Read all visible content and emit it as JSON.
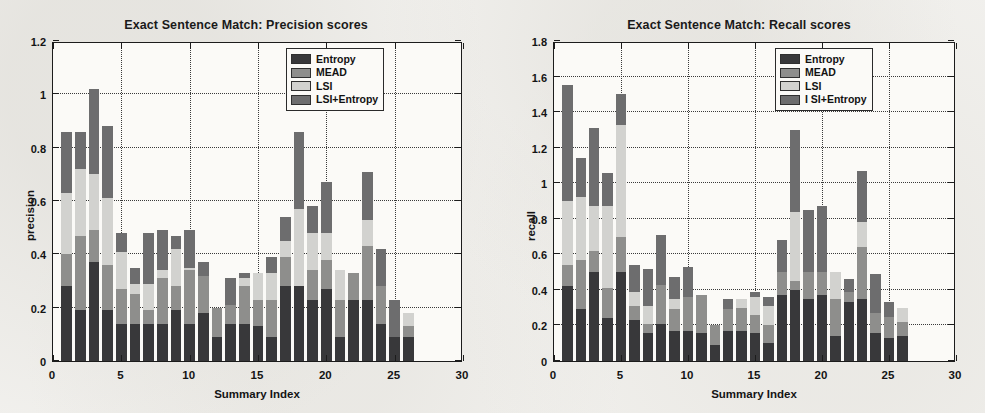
{
  "figure": {
    "panels": [
      "precision",
      "recall"
    ]
  },
  "chart_data": [
    {
      "type": "bar",
      "barmode": "stacked",
      "title": "Exact Sentence Match: Precision scores",
      "xlabel": "Summary Index",
      "ylabel": "precision",
      "xlim": [
        0,
        30
      ],
      "ylim": [
        0,
        1.2
      ],
      "xticks": [
        0,
        5,
        10,
        15,
        20,
        25,
        30
      ],
      "xticklabels": [
        "0",
        "5",
        "10",
        "15",
        "20",
        "25",
        "30"
      ],
      "yticks": [
        0,
        0.2,
        0.4,
        0.6,
        0.8,
        1,
        1.2
      ],
      "yticklabels": [
        "0",
        "0.2",
        "0.4",
        "0.6",
        "0.8",
        "1",
        "1.2"
      ],
      "grid": true,
      "grid_style": "dotted",
      "legend_position": "top-right",
      "legend": [
        "Entropy",
        "MEAD",
        "LSI",
        "LSI+Entropy"
      ],
      "colors": [
        "#38383a",
        "#8e8e8c",
        "#d2d2cf",
        "#6d6d6e"
      ],
      "categories": [
        1,
        2,
        3,
        4,
        5,
        6,
        7,
        8,
        9,
        10,
        11,
        12,
        13,
        14,
        15,
        16,
        17,
        18,
        19,
        20,
        21,
        22,
        23,
        24,
        25,
        26
      ],
      "series": [
        {
          "name": "Entropy",
          "values": [
            0.28,
            0.19,
            0.37,
            0.19,
            0.14,
            0.14,
            0.14,
            0.14,
            0.19,
            0.14,
            0.18,
            0.09,
            0.14,
            0.14,
            0.13,
            0.09,
            0.28,
            0.28,
            0.23,
            0.27,
            0.09,
            0.23,
            0.23,
            0.14,
            0.09,
            0.09
          ]
        },
        {
          "name": "MEAD",
          "values": [
            0.12,
            0.28,
            0.12,
            0.17,
            0.13,
            0.11,
            0.05,
            0.17,
            0.09,
            0.2,
            0.14,
            0.11,
            0.07,
            0.14,
            0.1,
            0.14,
            0.11,
            0.0,
            0.11,
            0.11,
            0.14,
            0.1,
            0.2,
            0.14,
            0.0,
            0.04
          ]
        },
        {
          "name": "LSI",
          "values": [
            0.23,
            0.25,
            0.21,
            0.25,
            0.14,
            0.04,
            0.1,
            0.03,
            0.14,
            0.01,
            0.0,
            0.0,
            0.0,
            0.03,
            0.1,
            0.1,
            0.06,
            0.29,
            0.14,
            0.1,
            0.11,
            0.0,
            0.1,
            0.0,
            0.0,
            0.05
          ]
        },
        {
          "name": "LSI+Entropy",
          "values": [
            0.23,
            0.14,
            0.32,
            0.27,
            0.07,
            0.06,
            0.19,
            0.15,
            0.05,
            0.14,
            0.05,
            0.0,
            0.1,
            0.02,
            0.0,
            0.06,
            0.09,
            0.29,
            0.1,
            0.19,
            0.0,
            0.0,
            0.18,
            0.14,
            0.14,
            0.0
          ]
        }
      ]
    },
    {
      "type": "bar",
      "barmode": "stacked",
      "title": "Exact Sentence Match: Recall scores",
      "xlabel": "Summary Index",
      "ylabel": "recall",
      "xlim": [
        0,
        30
      ],
      "ylim": [
        0,
        1.8
      ],
      "xticks": [
        0,
        5,
        10,
        15,
        20,
        25,
        30
      ],
      "xticklabels": [
        "0",
        "5",
        "10",
        "15",
        "20",
        "25",
        "30"
      ],
      "yticks": [
        0,
        0.2,
        0.4,
        0.6,
        0.8,
        1,
        1.2,
        1.4,
        1.6,
        1.8
      ],
      "yticklabels": [
        "0",
        "0.2",
        "0.4",
        "0.6",
        "0.8",
        "1",
        "1.2",
        "1.4",
        "1.6",
        "1.8"
      ],
      "grid": true,
      "grid_style": "dotted",
      "legend_position": "top-right",
      "legend": [
        "Entropy",
        "MEAD",
        "LSI",
        "LSI+Entropy"
      ],
      "colors": [
        "#38383a",
        "#8e8e8c",
        "#d2d2cf",
        "#6d6d6e"
      ],
      "categories": [
        1,
        2,
        3,
        4,
        5,
        6,
        7,
        8,
        9,
        10,
        11,
        12,
        13,
        14,
        15,
        16,
        17,
        18,
        19,
        20,
        21,
        22,
        23,
        24,
        25,
        26
      ],
      "series": [
        {
          "name": "Entropy",
          "values": [
            0.42,
            0.29,
            0.5,
            0.24,
            0.5,
            0.23,
            0.16,
            0.21,
            0.17,
            0.17,
            0.16,
            0.09,
            0.17,
            0.17,
            0.16,
            0.1,
            0.37,
            0.4,
            0.35,
            0.37,
            0.14,
            0.33,
            0.35,
            0.16,
            0.13,
            0.14
          ]
        },
        {
          "name": "MEAD",
          "values": [
            0.12,
            0.28,
            0.12,
            0.17,
            0.2,
            0.08,
            0.05,
            0.22,
            0.12,
            0.19,
            0.21,
            0.11,
            0.12,
            0.13,
            0.1,
            0.1,
            0.13,
            0.05,
            0.15,
            0.13,
            0.21,
            0.06,
            0.29,
            0.11,
            0.12,
            0.08
          ]
        },
        {
          "name": "LSI",
          "values": [
            0.36,
            0.35,
            0.25,
            0.46,
            0.63,
            0.08,
            0.1,
            0.0,
            0.06,
            0.0,
            0.0,
            0.0,
            0.0,
            0.05,
            0.1,
            0.11,
            0.0,
            0.39,
            0.0,
            0.0,
            0.15,
            0.0,
            0.14,
            0.0,
            0.0,
            0.08
          ]
        },
        {
          "name": "LSI+Entropy",
          "values": [
            0.65,
            0.22,
            0.44,
            0.19,
            0.17,
            0.15,
            0.21,
            0.28,
            0.12,
            0.17,
            0.0,
            0.0,
            0.06,
            0.0,
            0.03,
            0.05,
            0.18,
            0.46,
            0.35,
            0.37,
            0.0,
            0.07,
            0.29,
            0.22,
            0.08,
            0.0
          ]
        }
      ]
    }
  ]
}
